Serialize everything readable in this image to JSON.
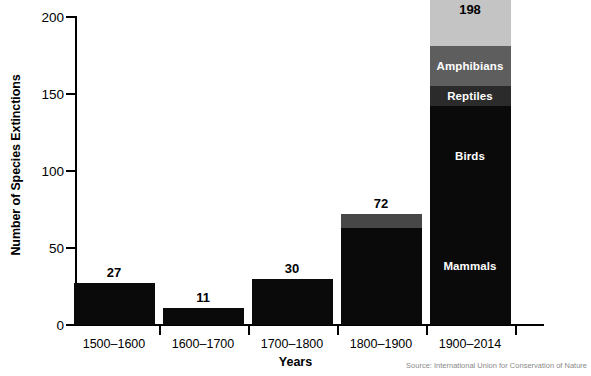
{
  "chart_data": {
    "type": "bar",
    "subtype": "stacked-bar",
    "title": "",
    "xlabel": "Years",
    "ylabel": "Number of Species Extinctions",
    "ylim": [
      0,
      200
    ],
    "yticks": [
      0,
      50,
      100,
      150,
      200
    ],
    "grid": false,
    "legend_position": "in-bar-labels",
    "categories": [
      "1500–1600",
      "1600–1700",
      "1700–1800",
      "1800–1900",
      "1900–2014"
    ],
    "totals": [
      27,
      11,
      30,
      72,
      198
    ],
    "series": [
      {
        "name": "Mammals",
        "color": "#0a0a0a",
        "values": [
          25,
          10,
          27,
          63,
          77
        ]
      },
      {
        "name": "Birds",
        "color": "#0a0a0a",
        "values": [
          2,
          1,
          3,
          0,
          65
        ]
      },
      {
        "name": "Reptiles",
        "color": "#2b2b2b",
        "values": [
          0,
          0,
          0,
          0,
          13
        ]
      },
      {
        "name": "Amphibians",
        "color": "#5e5e5e",
        "values": [
          0,
          0,
          0,
          9,
          26
        ]
      },
      {
        "name": "Fish",
        "color": "#c4c4c4",
        "values": [
          0,
          0,
          0,
          0,
          67
        ]
      }
    ],
    "bars": [
      {
        "category": "1500–1600",
        "total": 27,
        "total_label": "27",
        "segments": [
          {
            "name": "Mammals",
            "value": 27,
            "color": "#0a0a0a",
            "label": ""
          }
        ]
      },
      {
        "category": "1600–1700",
        "total": 11,
        "total_label": "11",
        "segments": [
          {
            "name": "Mammals",
            "value": 11,
            "color": "#0a0a0a",
            "label": ""
          }
        ]
      },
      {
        "category": "1700–1800",
        "total": 30,
        "total_label": "30",
        "segments": [
          {
            "name": "Mammals",
            "value": 30,
            "color": "#0a0a0a",
            "label": ""
          }
        ]
      },
      {
        "category": "1800–1900",
        "total": 72,
        "total_label": "72",
        "segments": [
          {
            "name": "Mammals",
            "value": 63,
            "color": "#0a0a0a",
            "label": ""
          },
          {
            "name": "Amphibians",
            "value": 9,
            "color": "#474747",
            "label": ""
          }
        ]
      },
      {
        "category": "1900–2014",
        "total": 198,
        "total_label": "198",
        "segments": [
          {
            "name": "Mammals",
            "value": 77,
            "color": "#0a0a0a",
            "label": "Mammals"
          },
          {
            "name": "Birds",
            "value": 65,
            "color": "#0a0a0a",
            "label": "Birds"
          },
          {
            "name": "Reptiles",
            "value": 13,
            "color": "#2b2b2b",
            "label": "Reptiles"
          },
          {
            "name": "Amphibians",
            "value": 26,
            "color": "#5e5e5e",
            "label": "Amphibians"
          },
          {
            "name": "Fish",
            "value": 67,
            "color": "#c4c4c4",
            "label": "Fish"
          }
        ]
      }
    ]
  },
  "axis": {
    "y_title": "Number of Species Extinctions",
    "x_title": "Years",
    "y_tick_labels": [
      "0",
      "50",
      "100",
      "150",
      "200"
    ],
    "x_tick_labels": [
      "1500–1600",
      "1600–1700",
      "1700–1800",
      "1800–1900",
      "1900–2014"
    ]
  },
  "footer": {
    "source": "Source: International Union for Conservation of Nature"
  },
  "colors": {
    "background": "#ffffff",
    "axis": "#000000",
    "text": "#000000",
    "source_text": "#8a8a8a",
    "fish": "#c4c4c4",
    "amphibians": "#5e5e5e",
    "reptiles": "#2b2b2b",
    "birds": "#0a0a0a",
    "mammals": "#0a0a0a"
  }
}
